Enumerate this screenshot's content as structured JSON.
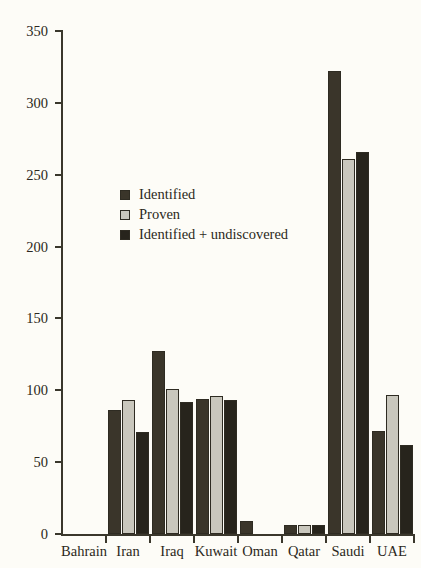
{
  "chart_data": {
    "type": "bar",
    "title": "",
    "subtitle": "",
    "xlabel": "",
    "ylabel": "",
    "grid": false,
    "legend_position": "inside-upper-left",
    "ylim": [
      0,
      350
    ],
    "yticks": [
      0,
      50,
      100,
      150,
      200,
      250,
      300,
      350
    ],
    "categories": [
      "Bahrain",
      "Iran",
      "Iraq",
      "Kuwait",
      "Oman",
      "Qatar",
      "Saudi",
      "UAE"
    ],
    "series": [
      {
        "name": "Identified",
        "color": "#3a352a",
        "values": [
          0,
          86,
          127,
          94,
          9,
          6,
          322,
          72
        ]
      },
      {
        "name": "Proven",
        "color": "#c9c7bd",
        "values": [
          0,
          93,
          101,
          96,
          0,
          6,
          261,
          97
        ]
      },
      {
        "name": "Identified + undiscovered",
        "color": "#27241c",
        "values": [
          0,
          71,
          92,
          93,
          0,
          6,
          266,
          62
        ]
      }
    ]
  },
  "axis": {
    "y_tick_labels": [
      "350",
      "300",
      "250",
      "200",
      "150",
      "100",
      "50",
      "0"
    ]
  },
  "legend": {
    "items": [
      {
        "label": "Identified"
      },
      {
        "label": "Proven"
      },
      {
        "label": "Identified + undiscovered"
      }
    ]
  },
  "colors": {
    "background": "#fdfcf7",
    "axis": "#3a372c",
    "text": "#2b2820",
    "series_identified": "#3a352a",
    "series_proven": "#c9c7bd",
    "series_identified_undiscovered": "#27241c"
  }
}
